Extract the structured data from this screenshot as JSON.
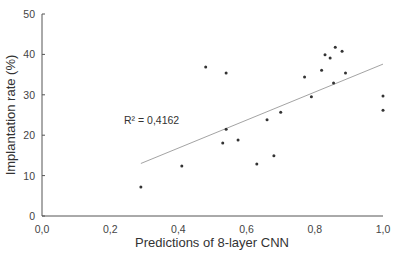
{
  "chart_data": {
    "type": "scatter",
    "title": "",
    "xlabel": "Predictions of 8-layer CNN",
    "ylabel": "Implantation rate (%)",
    "xlim": [
      0.0,
      1.0
    ],
    "ylim": [
      0,
      50
    ],
    "x_ticks": [
      "0,0",
      "0,2",
      "0,4",
      "0,6",
      "0,8",
      "1,0"
    ],
    "y_ticks": [
      "0",
      "10",
      "20",
      "30",
      "40",
      "50"
    ],
    "grid": false,
    "legend": null,
    "annotation": "R² = 0,4162",
    "series": [
      {
        "name": "Observations",
        "points": [
          [
            0.29,
            7.2
          ],
          [
            0.41,
            12.4
          ],
          [
            0.48,
            36.9
          ],
          [
            0.54,
            35.4
          ],
          [
            0.54,
            21.5
          ],
          [
            0.53,
            18.1
          ],
          [
            0.575,
            18.8
          ],
          [
            0.63,
            12.9
          ],
          [
            0.66,
            23.8
          ],
          [
            0.68,
            14.9
          ],
          [
            0.7,
            25.7
          ],
          [
            0.77,
            34.4
          ],
          [
            0.79,
            29.5
          ],
          [
            0.82,
            36.1
          ],
          [
            0.83,
            39.9
          ],
          [
            0.845,
            39.1
          ],
          [
            0.855,
            32.9
          ],
          [
            0.86,
            41.8
          ],
          [
            0.88,
            40.8
          ],
          [
            0.89,
            35.4
          ],
          [
            1.0,
            29.7
          ],
          [
            1.0,
            26.2
          ]
        ]
      }
    ],
    "trendline": {
      "type": "linear",
      "x": [
        0.29,
        1.0
      ],
      "y": [
        13.0,
        37.6
      ],
      "r_squared": "0,4162"
    }
  },
  "colors": {
    "axis": "#555555",
    "points": "#333333",
    "trendline": "#999999"
  }
}
